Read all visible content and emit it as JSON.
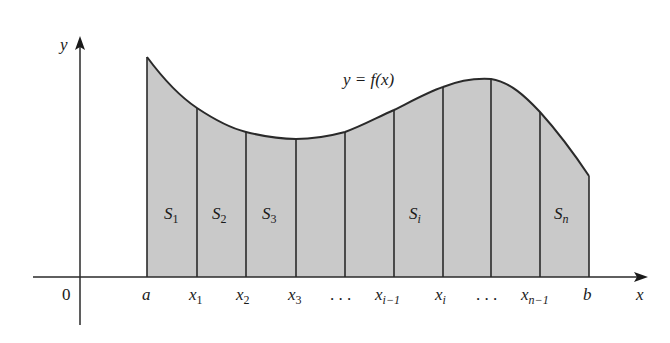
{
  "figure": {
    "type": "area-under-curve-strips",
    "curve_label": "y = f(x)",
    "axes": {
      "x_label": "x",
      "y_label": "y",
      "origin_label": "0"
    },
    "x_ticks": [
      {
        "base": "a",
        "sub": ""
      },
      {
        "base": "x",
        "sub": "1"
      },
      {
        "base": "x",
        "sub": "2"
      },
      {
        "base": "x",
        "sub": "3"
      },
      {
        "base": ". . .",
        "sub": ""
      },
      {
        "base": "x",
        "sub": "i−1"
      },
      {
        "base": "x",
        "sub": "i"
      },
      {
        "base": ". . .",
        "sub": ""
      },
      {
        "base": "x",
        "sub": "n−1"
      },
      {
        "base": "b",
        "sub": ""
      }
    ],
    "strip_labels": [
      {
        "base": "S",
        "sub": "1"
      },
      {
        "base": "S",
        "sub": "2"
      },
      {
        "base": "S",
        "sub": "3"
      },
      {
        "base": "S",
        "sub": "i"
      },
      {
        "base": "S",
        "sub": "n"
      }
    ],
    "colors": {
      "fill": "#c9c9c9",
      "stroke": "#2a2a2a",
      "text": "#1a1a1a"
    }
  }
}
